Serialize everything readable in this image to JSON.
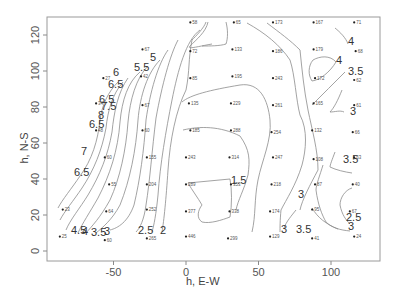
{
  "chart_data": {
    "type": "contour",
    "title": "",
    "xlabel": "h, E-W",
    "ylabel": "h, N-S",
    "xlim": [
      -95,
      133
    ],
    "ylim": [
      -5,
      130
    ],
    "xticks": [
      -50,
      0,
      50,
      100
    ],
    "yticks": [
      0,
      20,
      40,
      60,
      80,
      100,
      120
    ],
    "grid": false,
    "legend": null,
    "points": [
      {
        "x": 3,
        "y": 127,
        "label": "58"
      },
      {
        "x": 33,
        "y": 127,
        "label": "65"
      },
      {
        "x": 60,
        "y": 127,
        "label": "173"
      },
      {
        "x": 88,
        "y": 127,
        "label": "167"
      },
      {
        "x": 116,
        "y": 127,
        "label": "71"
      },
      {
        "x": -30,
        "y": 112,
        "label": "67"
      },
      {
        "x": 3,
        "y": 111,
        "label": "72"
      },
      {
        "x": 32,
        "y": 112,
        "label": "133"
      },
      {
        "x": 60,
        "y": 111,
        "label": "186"
      },
      {
        "x": 88,
        "y": 112,
        "label": "179"
      },
      {
        "x": 117,
        "y": 111,
        "label": "68"
      },
      {
        "x": -57,
        "y": 96,
        "label": "27"
      },
      {
        "x": -31,
        "y": 97,
        "label": "42"
      },
      {
        "x": 3,
        "y": 96,
        "label": "85"
      },
      {
        "x": 32,
        "y": 97,
        "label": "195"
      },
      {
        "x": 60,
        "y": 96,
        "label": "243"
      },
      {
        "x": 89,
        "y": 96,
        "label": "172"
      },
      {
        "x": 116,
        "y": 95,
        "label": "62"
      },
      {
        "x": -62,
        "y": 82,
        "label": "34"
      },
      {
        "x": -30,
        "y": 81,
        "label": "67"
      },
      {
        "x": 2,
        "y": 82,
        "label": "135"
      },
      {
        "x": 31,
        "y": 82,
        "label": "229"
      },
      {
        "x": 60,
        "y": 81,
        "label": "261"
      },
      {
        "x": 88,
        "y": 82,
        "label": "165"
      },
      {
        "x": 116,
        "y": 81,
        "label": "61"
      },
      {
        "x": -62,
        "y": 67,
        "label": "48"
      },
      {
        "x": -30,
        "y": 67,
        "label": "60"
      },
      {
        "x": 3,
        "y": 67,
        "label": "185"
      },
      {
        "x": 31,
        "y": 67,
        "label": "288"
      },
      {
        "x": 59,
        "y": 66,
        "label": "254"
      },
      {
        "x": 87,
        "y": 67,
        "label": "132"
      },
      {
        "x": 115,
        "y": 66,
        "label": "66"
      },
      {
        "x": -56,
        "y": 52,
        "label": "60"
      },
      {
        "x": -27,
        "y": 52,
        "label": "155"
      },
      {
        "x": 0,
        "y": 52,
        "label": "243"
      },
      {
        "x": 30,
        "y": 52,
        "label": "314"
      },
      {
        "x": 60,
        "y": 52,
        "label": "247"
      },
      {
        "x": 88,
        "y": 51,
        "label": "108"
      },
      {
        "x": 116,
        "y": 52,
        "label": "63"
      },
      {
        "x": -53,
        "y": 37,
        "label": "55"
      },
      {
        "x": -27,
        "y": 37,
        "label": "204"
      },
      {
        "x": 0,
        "y": 37,
        "label": "289"
      },
      {
        "x": 31,
        "y": 37,
        "label": "353"
      },
      {
        "x": 59,
        "y": 37,
        "label": "218"
      },
      {
        "x": 89,
        "y": 37,
        "label": "87"
      },
      {
        "x": 115,
        "y": 37,
        "label": "40"
      },
      {
        "x": -85,
        "y": 23,
        "label": "23"
      },
      {
        "x": -55,
        "y": 22,
        "label": "64"
      },
      {
        "x": -27,
        "y": 23,
        "label": "252"
      },
      {
        "x": 0,
        "y": 22,
        "label": "377"
      },
      {
        "x": 30,
        "y": 22,
        "label": "338"
      },
      {
        "x": 58,
        "y": 22,
        "label": "174"
      },
      {
        "x": 87,
        "y": 23,
        "label": "95"
      },
      {
        "x": 113,
        "y": 22,
        "label": "67"
      },
      {
        "x": -87,
        "y": 8,
        "label": "25"
      },
      {
        "x": -56,
        "y": 6,
        "label": "60"
      },
      {
        "x": -27,
        "y": 7,
        "label": "265"
      },
      {
        "x": 0,
        "y": 8,
        "label": "446"
      },
      {
        "x": 29,
        "y": 7,
        "label": "299"
      },
      {
        "x": 58,
        "y": 8,
        "label": "129"
      },
      {
        "x": 87,
        "y": 7,
        "label": "41"
      },
      {
        "x": 116,
        "y": 8,
        "label": "24"
      }
    ],
    "contour_levels": [
      1.5,
      2,
      2.5,
      3,
      3.5,
      4,
      4.5,
      5,
      5.5,
      6,
      6.5,
      7,
      7.5,
      8
    ],
    "contour_labels": [
      {
        "text": "6",
        "px": 113,
        "py": 76
      },
      {
        "text": "6.5",
        "px": 108,
        "py": 88
      },
      {
        "text": "5.5",
        "px": 134,
        "py": 71
      },
      {
        "text": "5",
        "px": 150,
        "py": 61
      },
      {
        "text": "6.5",
        "px": 99,
        "py": 103
      },
      {
        "text": "7.5",
        "px": 101,
        "py": 110
      },
      {
        "text": "8",
        "px": 98,
        "py": 119
      },
      {
        "text": "6.5",
        "px": 89,
        "py": 128
      },
      {
        "text": "7",
        "px": 81,
        "py": 155
      },
      {
        "text": "6.5",
        "px": 74,
        "py": 176
      },
      {
        "text": "4.5",
        "px": 71,
        "py": 234
      },
      {
        "text": "4",
        "px": 82,
        "py": 235
      },
      {
        "text": "3.5",
        "px": 91,
        "py": 236
      },
      {
        "text": "3",
        "px": 104,
        "py": 235
      },
      {
        "text": "2.5",
        "px": 138,
        "py": 234
      },
      {
        "text": "2",
        "px": 160,
        "py": 234
      },
      {
        "text": "1.5",
        "px": 231,
        "py": 184
      },
      {
        "text": "4",
        "px": 348,
        "py": 45
      },
      {
        "text": "4",
        "px": 336,
        "py": 64
      },
      {
        "text": "3.5",
        "px": 348,
        "py": 75
      },
      {
        "text": "3",
        "px": 350,
        "py": 115
      },
      {
        "text": "3",
        "px": 298,
        "py": 198
      },
      {
        "text": "3.5",
        "px": 343,
        "py": 163
      },
      {
        "text": "3",
        "px": 281,
        "py": 233
      },
      {
        "text": "3.5",
        "px": 296,
        "py": 233
      },
      {
        "text": "2.5",
        "px": 346,
        "py": 221
      },
      {
        "text": "3",
        "px": 348,
        "py": 230
      }
    ]
  }
}
